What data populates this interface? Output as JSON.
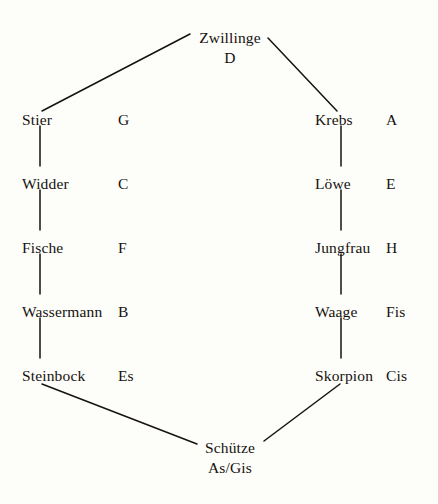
{
  "diagram": {
    "background_color": "#fdfdfa",
    "ink_color": "#16120e",
    "nodes": [
      {
        "id": "zwillinge",
        "sign": "Zwillinge",
        "tone": "D",
        "position": "top",
        "x": 230,
        "y": 30
      },
      {
        "id": "stier",
        "sign": "Stier",
        "tone": "G",
        "position": "left-1",
        "x": 22,
        "y": 112
      },
      {
        "id": "widder",
        "sign": "Widder",
        "tone": "C",
        "position": "left-2",
        "x": 22,
        "y": 176
      },
      {
        "id": "fische",
        "sign": "Fische",
        "tone": "F",
        "position": "left-3",
        "x": 22,
        "y": 240
      },
      {
        "id": "wassermann",
        "sign": "Wassermann",
        "tone": "B",
        "position": "left-4",
        "x": 22,
        "y": 304
      },
      {
        "id": "steinbock",
        "sign": "Steinbock",
        "tone": "Es",
        "position": "left-5",
        "x": 22,
        "y": 368
      },
      {
        "id": "krebs",
        "sign": "Krebs",
        "tone": "A",
        "position": "right-1",
        "x": 315,
        "y": 112
      },
      {
        "id": "loewe",
        "sign": "Löwe",
        "tone": "E",
        "position": "right-2",
        "x": 315,
        "y": 176
      },
      {
        "id": "jungfrau",
        "sign": "Jungfrau",
        "tone": "H",
        "position": "right-3",
        "x": 315,
        "y": 240
      },
      {
        "id": "waage",
        "sign": "Waage",
        "tone": "Fis",
        "position": "right-4",
        "x": 315,
        "y": 304
      },
      {
        "id": "skorpion",
        "sign": "Skorpion",
        "tone": "Cis",
        "position": "right-5",
        "x": 315,
        "y": 368
      },
      {
        "id": "schuetze",
        "sign": "Schütze",
        "tone": "As/Gis",
        "position": "bottom",
        "x": 230,
        "y": 440
      }
    ],
    "edges": [
      {
        "from": "stier",
        "to": "zwillinge",
        "kind": "diagonal",
        "x1": 42,
        "y1": 111,
        "x2": 190,
        "y2": 34
      },
      {
        "from": "zwillinge",
        "to": "krebs",
        "kind": "diagonal",
        "x1": 268,
        "y1": 38,
        "x2": 337,
        "y2": 111
      },
      {
        "from": "stier",
        "to": "widder",
        "kind": "vertical",
        "x1": 40,
        "y1": 126,
        "x2": 40,
        "y2": 166
      },
      {
        "from": "widder",
        "to": "fische",
        "kind": "vertical",
        "x1": 40,
        "y1": 190,
        "x2": 40,
        "y2": 230
      },
      {
        "from": "fische",
        "to": "wassermann",
        "kind": "vertical",
        "x1": 40,
        "y1": 254,
        "x2": 40,
        "y2": 294
      },
      {
        "from": "wassermann",
        "to": "steinbock",
        "kind": "vertical",
        "x1": 40,
        "y1": 318,
        "x2": 40,
        "y2": 358
      },
      {
        "from": "krebs",
        "to": "loewe",
        "kind": "vertical",
        "x1": 341,
        "y1": 126,
        "x2": 341,
        "y2": 166
      },
      {
        "from": "loewe",
        "to": "jungfrau",
        "kind": "vertical",
        "x1": 341,
        "y1": 190,
        "x2": 341,
        "y2": 230
      },
      {
        "from": "jungfrau",
        "to": "waage",
        "kind": "vertical",
        "x1": 341,
        "y1": 254,
        "x2": 341,
        "y2": 294
      },
      {
        "from": "waage",
        "to": "skorpion",
        "kind": "vertical",
        "x1": 341,
        "y1": 318,
        "x2": 341,
        "y2": 358
      },
      {
        "from": "steinbock",
        "to": "schuetze",
        "kind": "diagonal",
        "x1": 42,
        "y1": 384,
        "x2": 197,
        "y2": 444
      },
      {
        "from": "schuetze",
        "to": "skorpion",
        "kind": "diagonal",
        "x1": 264,
        "y1": 441,
        "x2": 340,
        "y2": 384
      }
    ]
  }
}
